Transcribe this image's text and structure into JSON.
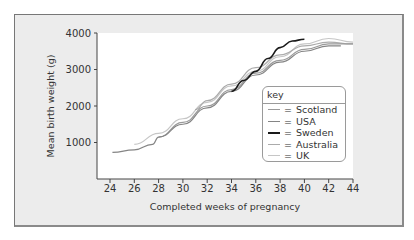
{
  "chart_data": {
    "type": "line",
    "title": "",
    "xlabel": "Completed weeks of pregnancy",
    "ylabel": "Mean birth weight (g)",
    "xlim": [
      23,
      44
    ],
    "ylim": [
      0,
      4000
    ],
    "xticks": [
      24,
      26,
      28,
      30,
      32,
      34,
      36,
      38,
      40,
      42,
      44
    ],
    "yticks": [
      1000,
      2000,
      3000,
      4000
    ],
    "grid": false,
    "legend_title": "key",
    "legend_position": "inside-right",
    "series": [
      {
        "name": "Scotland",
        "color": "#9a9a9a",
        "x": [
          28,
          30,
          32,
          34,
          36,
          38,
          40,
          42,
          44
        ],
        "y": [
          1150,
          1550,
          2000,
          2450,
          2900,
          3250,
          3550,
          3700,
          3700
        ]
      },
      {
        "name": "USA",
        "color": "#858585",
        "x": [
          24.2,
          26,
          27.5,
          28,
          30,
          32,
          34,
          36,
          38,
          40,
          42,
          43
        ],
        "y": [
          730,
          800,
          950,
          1150,
          1500,
          1950,
          2400,
          2850,
          3200,
          3500,
          3650,
          3650
        ]
      },
      {
        "name": "Sweden",
        "color": "#1a1a1a",
        "x": [
          34,
          35,
          36,
          37,
          38,
          39,
          40
        ],
        "y": [
          2400,
          2700,
          2950,
          3300,
          3600,
          3780,
          3830
        ]
      },
      {
        "name": "Australia",
        "color": "#ababab",
        "x": [
          31,
          32,
          34,
          36,
          38,
          40,
          42,
          44
        ],
        "y": [
          1900,
          2150,
          2600,
          3050,
          3400,
          3650,
          3750,
          3700
        ]
      },
      {
        "name": "UK",
        "color": "#c6c6c6",
        "x": [
          26,
          28,
          30,
          32,
          34,
          36,
          38,
          40,
          42,
          44
        ],
        "y": [
          950,
          1250,
          1650,
          2100,
          2550,
          2950,
          3350,
          3700,
          3850,
          3750
        ]
      }
    ]
  }
}
